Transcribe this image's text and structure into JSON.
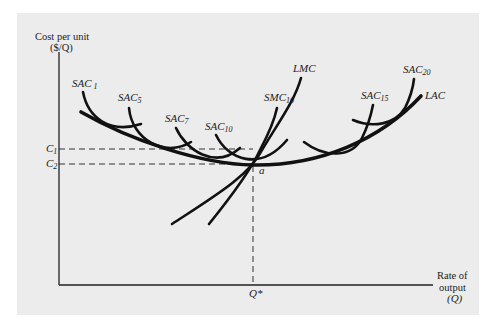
{
  "diagram": {
    "type": "economics cost curves",
    "y_axis": {
      "line1": "Cost per unit",
      "line2": "($/Q)"
    },
    "x_axis": {
      "line1": "Rate of",
      "line2": "output",
      "line3": "(Q)"
    },
    "ticks": {
      "c1": {
        "main": "C",
        "sub": "1"
      },
      "c2": {
        "main": "C",
        "sub": "2"
      },
      "q_star": "Q*"
    },
    "point_label": "a",
    "curves": {
      "sac1": {
        "main": "SAC",
        "sub": "1"
      },
      "sac5": {
        "main": "SAC",
        "sub": "5"
      },
      "sac7": {
        "main": "SAC",
        "sub": "7"
      },
      "sac10": {
        "main": "SAC",
        "sub": "10"
      },
      "smc10": {
        "main": "SMC",
        "sub": "10"
      },
      "lmc": {
        "main": "LMC",
        "sub": ""
      },
      "sac15": {
        "main": "SAC",
        "sub": "15"
      },
      "sac20": {
        "main": "SAC",
        "sub": "20"
      },
      "lac": {
        "main": "LAC",
        "sub": ""
      }
    },
    "colors": {
      "panel": "#ececec",
      "ink": "#111111"
    }
  }
}
